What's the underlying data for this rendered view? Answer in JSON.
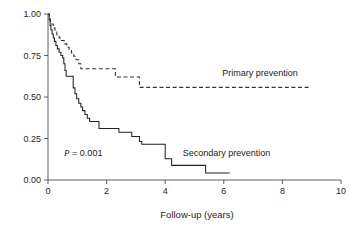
{
  "chart_data": {
    "type": "line",
    "title": "",
    "xlabel": "Follow-up (years)",
    "ylabel": "",
    "xlim": [
      0,
      10
    ],
    "ylim": [
      0,
      1.0
    ],
    "grid": false,
    "legend_position": "inline-annotation",
    "xticks": [
      "0",
      "2",
      "4",
      "6",
      "8",
      "10"
    ],
    "xtick_values": [
      0,
      2,
      4,
      6,
      8,
      10
    ],
    "yticks": [
      "0.00",
      "0.25",
      "0.50",
      "0.75",
      "1.00"
    ],
    "ytick_values": [
      0.0,
      0.25,
      0.5,
      0.75,
      1.0
    ],
    "annotations": [
      {
        "name": "p-value",
        "text_italic": "P",
        "text_rest": " = 0.001",
        "x": 0.55,
        "y": 0.145
      }
    ],
    "series": [
      {
        "name": "Primary prevention",
        "style": "dashed",
        "color": "#333333",
        "label_x": 5.95,
        "label_y": 0.625,
        "points": [
          [
            0.0,
            1.0
          ],
          [
            0.05,
            0.975
          ],
          [
            0.08,
            0.955
          ],
          [
            0.12,
            0.94
          ],
          [
            0.18,
            0.915
          ],
          [
            0.24,
            0.895
          ],
          [
            0.3,
            0.875
          ],
          [
            0.38,
            0.855
          ],
          [
            0.46,
            0.84
          ],
          [
            0.55,
            0.82
          ],
          [
            0.64,
            0.8
          ],
          [
            0.72,
            0.785
          ],
          [
            0.8,
            0.765
          ],
          [
            0.88,
            0.745
          ],
          [
            0.96,
            0.725
          ],
          [
            1.05,
            0.7
          ],
          [
            1.12,
            0.67
          ],
          [
            2.28,
            0.67
          ],
          [
            2.3,
            0.62
          ],
          [
            3.08,
            0.62
          ],
          [
            3.12,
            0.558
          ],
          [
            8.9,
            0.558
          ]
        ]
      },
      {
        "name": "Secondary prevention",
        "style": "solid",
        "color": "#222222",
        "label_x": 4.6,
        "label_y": 0.145,
        "points": [
          [
            0.0,
            1.0
          ],
          [
            0.04,
            0.965
          ],
          [
            0.07,
            0.93
          ],
          [
            0.1,
            0.905
          ],
          [
            0.14,
            0.88
          ],
          [
            0.18,
            0.855
          ],
          [
            0.22,
            0.835
          ],
          [
            0.27,
            0.81
          ],
          [
            0.32,
            0.79
          ],
          [
            0.38,
            0.77
          ],
          [
            0.44,
            0.75
          ],
          [
            0.5,
            0.735
          ],
          [
            0.54,
            0.7
          ],
          [
            0.58,
            0.66
          ],
          [
            0.62,
            0.625
          ],
          [
            0.84,
            0.625
          ],
          [
            0.86,
            0.555
          ],
          [
            0.92,
            0.52
          ],
          [
            0.98,
            0.49
          ],
          [
            1.05,
            0.462
          ],
          [
            1.12,
            0.44
          ],
          [
            1.18,
            0.418
          ],
          [
            1.26,
            0.395
          ],
          [
            1.34,
            0.372
          ],
          [
            1.42,
            0.352
          ],
          [
            1.7,
            0.352
          ],
          [
            1.74,
            0.31
          ],
          [
            2.38,
            0.31
          ],
          [
            2.42,
            0.288
          ],
          [
            2.82,
            0.288
          ],
          [
            2.86,
            0.262
          ],
          [
            3.08,
            0.262
          ],
          [
            3.12,
            0.232
          ],
          [
            3.2,
            0.215
          ],
          [
            3.96,
            0.215
          ],
          [
            4.0,
            0.128
          ],
          [
            4.18,
            0.128
          ],
          [
            4.22,
            0.088
          ],
          [
            5.34,
            0.088
          ],
          [
            5.38,
            0.042
          ],
          [
            6.2,
            0.042
          ]
        ]
      }
    ]
  }
}
